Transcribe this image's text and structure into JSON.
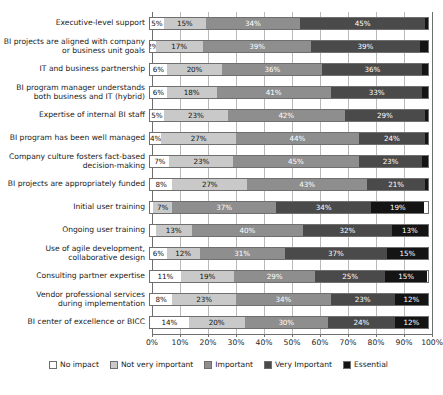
{
  "chart_data": {
    "type": "bar",
    "subtype": "stacked-horizontal-100",
    "title": "",
    "xlabel": "",
    "ylabel": "",
    "xlim": [
      0,
      100
    ],
    "grid": true,
    "legend_position": "bottom",
    "tick_labels": [
      "0%",
      "10%",
      "20%",
      "30%",
      "40%",
      "50%",
      "60%",
      "70%",
      "80%",
      "90%",
      "100%"
    ],
    "ticks": [
      0,
      10,
      20,
      30,
      40,
      50,
      60,
      70,
      80,
      90,
      100
    ],
    "legend": [
      {
        "name": "No impact",
        "color": "#ffffff"
      },
      {
        "name": "Not very important",
        "color": "#c9c9c9"
      },
      {
        "name": "Important",
        "color": "#8e8e8e"
      },
      {
        "name": "Very Important",
        "color": "#4a4a4a"
      },
      {
        "name": "Essential",
        "color": "#141414"
      }
    ],
    "series": [
      {
        "name": "No impact",
        "values": [
          5,
          2,
          6,
          6,
          5,
          4,
          7,
          8,
          1,
          2,
          6,
          11,
          8,
          14
        ]
      },
      {
        "name": "Not very important",
        "values": [
          15,
          17,
          20,
          18,
          23,
          27,
          23,
          27,
          7,
          13,
          12,
          19,
          23,
          20
        ]
      },
      {
        "name": "Important",
        "values": [
          34,
          39,
          36,
          41,
          42,
          44,
          45,
          43,
          37,
          40,
          31,
          29,
          34,
          30
        ]
      },
      {
        "name": "Very Important",
        "values": [
          45,
          39,
          36,
          33,
          29,
          24,
          23,
          21,
          34,
          32,
          37,
          25,
          23,
          24
        ]
      },
      {
        "name": "Essential",
        "values": [
          1,
          3,
          2,
          2,
          1,
          1,
          2,
          1,
          19,
          13,
          15,
          15,
          12,
          12
        ]
      }
    ],
    "categories": [
      "Executive-level support",
      "BI projects are aligned with company\nor business unit goals",
      "IT and business partnership",
      "BI program manager understands\nboth business and IT (hybrid)",
      "Expertise of internal BI staff",
      "BI program has been well managed",
      "Company culture fosters fact-based\ndecision-making",
      "BI projects are appropriately funded",
      "Initial user training",
      "Ongoing user training",
      "Use of agile development,\ncollaborative design",
      "Consulting partner expertise",
      "Vendor professional services\nduring implementation",
      "BI center of excellence or BICC"
    ],
    "rows": [
      {
        "label": "Executive-level support",
        "segments": [
          {
            "series": "No impact",
            "value": 5,
            "label": "5%"
          },
          {
            "series": "Not very important",
            "value": 15,
            "label": "15%"
          },
          {
            "series": "Important",
            "value": 34,
            "label": "34%"
          },
          {
            "series": "Very Important",
            "value": 45,
            "label": "45%"
          },
          {
            "series": "Essential",
            "value": 1,
            "label": ""
          }
        ]
      },
      {
        "label": "BI projects are aligned with company\nor business unit goals",
        "segments": [
          {
            "series": "No impact",
            "value": 2,
            "label": "2%"
          },
          {
            "series": "Not very important",
            "value": 17,
            "label": "17%"
          },
          {
            "series": "Important",
            "value": 39,
            "label": "39%"
          },
          {
            "series": "Very Important",
            "value": 39,
            "label": "39%"
          },
          {
            "series": "Essential",
            "value": 3,
            "label": ""
          }
        ]
      },
      {
        "label": "IT and business partnership",
        "segments": [
          {
            "series": "No impact",
            "value": 6,
            "label": "6%"
          },
          {
            "series": "Not very important",
            "value": 20,
            "label": "20%"
          },
          {
            "series": "Important",
            "value": 36,
            "label": "36%"
          },
          {
            "series": "Very Important",
            "value": 36,
            "label": "36%"
          },
          {
            "series": "Essential",
            "value": 2,
            "label": ""
          }
        ]
      },
      {
        "label": "BI program manager understands\nboth business and IT (hybrid)",
        "segments": [
          {
            "series": "No impact",
            "value": 6,
            "label": "6%"
          },
          {
            "series": "Not very important",
            "value": 18,
            "label": "18%"
          },
          {
            "series": "Important",
            "value": 41,
            "label": "41%"
          },
          {
            "series": "Very Important",
            "value": 33,
            "label": "33%"
          },
          {
            "series": "Essential",
            "value": 2,
            "label": ""
          }
        ]
      },
      {
        "label": "Expertise of internal BI staff",
        "segments": [
          {
            "series": "No impact",
            "value": 5,
            "label": "5%"
          },
          {
            "series": "Not very important",
            "value": 23,
            "label": "23%"
          },
          {
            "series": "Important",
            "value": 42,
            "label": "42%"
          },
          {
            "series": "Very Important",
            "value": 29,
            "label": "29%"
          },
          {
            "series": "Essential",
            "value": 1,
            "label": ""
          }
        ]
      },
      {
        "label": "BI program has been well managed",
        "segments": [
          {
            "series": "No impact",
            "value": 4,
            "label": "4%"
          },
          {
            "series": "Not very important",
            "value": 27,
            "label": "27%"
          },
          {
            "series": "Important",
            "value": 44,
            "label": "44%"
          },
          {
            "series": "Very Important",
            "value": 24,
            "label": "24%"
          },
          {
            "series": "Essential",
            "value": 1,
            "label": ""
          }
        ]
      },
      {
        "label": "Company culture fosters fact-based\ndecision-making",
        "segments": [
          {
            "series": "No impact",
            "value": 7,
            "label": "7%"
          },
          {
            "series": "Not very important",
            "value": 23,
            "label": "23%"
          },
          {
            "series": "Important",
            "value": 45,
            "label": "45%"
          },
          {
            "series": "Very Important",
            "value": 23,
            "label": "23%"
          },
          {
            "series": "Essential",
            "value": 2,
            "label": ""
          }
        ]
      },
      {
        "label": "BI projects are appropriately funded",
        "segments": [
          {
            "series": "No impact",
            "value": 8,
            "label": "8%"
          },
          {
            "series": "Not very important",
            "value": 27,
            "label": "27%"
          },
          {
            "series": "Important",
            "value": 43,
            "label": "43%"
          },
          {
            "series": "Very Important",
            "value": 21,
            "label": "21%"
          },
          {
            "series": "Essential",
            "value": 1,
            "label": ""
          }
        ]
      },
      {
        "label": "Initial user training",
        "segments": [
          {
            "series": "No impact",
            "value": 1,
            "label": ""
          },
          {
            "series": "Not very important",
            "value": 7,
            "label": "7%"
          },
          {
            "series": "Important",
            "value": 37,
            "label": "37%"
          },
          {
            "series": "Very Important",
            "value": 34,
            "label": "34%"
          },
          {
            "series": "Essential",
            "value": 19,
            "label": "19%"
          }
        ]
      },
      {
        "label": "Ongoing user training",
        "segments": [
          {
            "series": "No impact",
            "value": 2,
            "label": ""
          },
          {
            "series": "Not very important",
            "value": 13,
            "label": "13%"
          },
          {
            "series": "Important",
            "value": 40,
            "label": "40%"
          },
          {
            "series": "Very Important",
            "value": 32,
            "label": "32%"
          },
          {
            "series": "Essential",
            "value": 13,
            "label": "13%"
          }
        ]
      },
      {
        "label": "Use of agile development,\ncollaborative design",
        "segments": [
          {
            "series": "No impact",
            "value": 6,
            "label": "6%"
          },
          {
            "series": "Not very important",
            "value": 12,
            "label": "12%"
          },
          {
            "series": "Important",
            "value": 31,
            "label": "31%"
          },
          {
            "series": "Very Important",
            "value": 37,
            "label": "37%"
          },
          {
            "series": "Essential",
            "value": 15,
            "label": "15%"
          }
        ]
      },
      {
        "label": "Consulting partner expertise",
        "segments": [
          {
            "series": "No impact",
            "value": 11,
            "label": "11%"
          },
          {
            "series": "Not very important",
            "value": 19,
            "label": "19%"
          },
          {
            "series": "Important",
            "value": 29,
            "label": "29%"
          },
          {
            "series": "Very Important",
            "value": 25,
            "label": "25%"
          },
          {
            "series": "Essential",
            "value": 15,
            "label": "15%"
          }
        ]
      },
      {
        "label": "Vendor professional services\nduring implementation",
        "segments": [
          {
            "series": "No impact",
            "value": 8,
            "label": "8%"
          },
          {
            "series": "Not very important",
            "value": 23,
            "label": "23%"
          },
          {
            "series": "Important",
            "value": 34,
            "label": "34%"
          },
          {
            "series": "Very Important",
            "value": 23,
            "label": "23%"
          },
          {
            "series": "Essential",
            "value": 12,
            "label": "12%"
          }
        ]
      },
      {
        "label": "BI center of excellence or BICC",
        "segments": [
          {
            "series": "No impact",
            "value": 14,
            "label": "14%"
          },
          {
            "series": "Not very important",
            "value": 20,
            "label": "20%"
          },
          {
            "series": "Important",
            "value": 30,
            "label": "30%"
          },
          {
            "series": "Very Important",
            "value": 24,
            "label": "24%"
          },
          {
            "series": "Essential",
            "value": 12,
            "label": "12%"
          }
        ]
      }
    ]
  }
}
